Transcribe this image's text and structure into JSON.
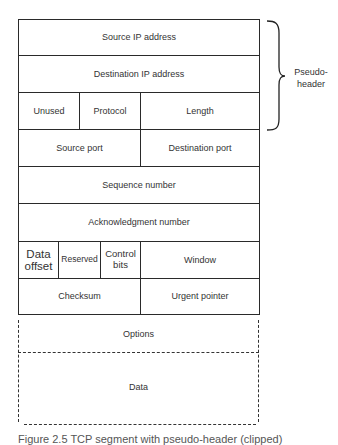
{
  "diagram": {
    "type": "tcp-segment-with-pseudo-header",
    "rows": [
      {
        "fields": [
          {
            "label": "Source IP address"
          }
        ]
      },
      {
        "fields": [
          {
            "label": "Destination IP address"
          }
        ]
      },
      {
        "fields": [
          {
            "label": "Unused"
          },
          {
            "label": "Protocol"
          },
          {
            "label": "Length"
          }
        ]
      },
      {
        "fields": [
          {
            "label": "Source port"
          },
          {
            "label": "Destination port"
          }
        ]
      },
      {
        "fields": [
          {
            "label": "Sequence number"
          }
        ]
      },
      {
        "fields": [
          {
            "label": "Acknowledgment number"
          }
        ]
      },
      {
        "fields": [
          {
            "label": "Data offset"
          },
          {
            "label": "Reserved"
          },
          {
            "label": "Control bits"
          },
          {
            "label": "Window"
          }
        ]
      },
      {
        "fields": [
          {
            "label": "Checksum"
          },
          {
            "label": "Urgent pointer"
          }
        ]
      }
    ],
    "optional_sections": [
      {
        "label": "Options"
      },
      {
        "label": "Data"
      }
    ],
    "brace": {
      "label": "Pseudo-header",
      "label_line1": "Pseudo-",
      "label_line2": "header",
      "spans_rows": [
        0,
        2
      ]
    },
    "caption": "Figure 2.5  TCP segment with pseudo-header (clipped)"
  }
}
